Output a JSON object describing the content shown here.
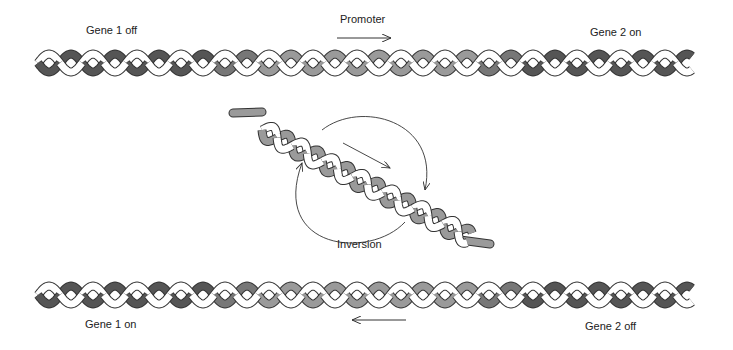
{
  "diagram": {
    "top": {
      "left_label": "Gene 1 off",
      "center_label": "Promoter",
      "right_label": "Gene 2 on",
      "arrow_direction": "right"
    },
    "middle": {
      "label": "Inversion"
    },
    "bottom": {
      "left_label": "Gene 1 on",
      "right_label": "Gene 2 off",
      "arrow_direction": "left"
    },
    "colors": {
      "dark_strand": "#555555",
      "light_strand": "#9a9a9a",
      "mid_strand": "#777777",
      "white_strand": "#ffffff",
      "outline": "#333333"
    }
  }
}
